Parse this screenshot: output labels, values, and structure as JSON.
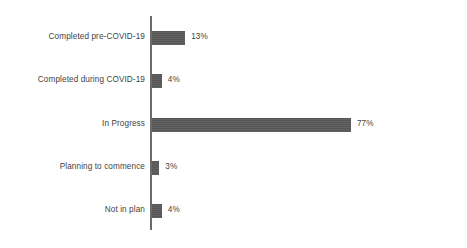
{
  "chart_data": {
    "type": "bar",
    "orientation": "horizontal",
    "title": "",
    "subtitle": "",
    "xlabel": "",
    "ylabel": "",
    "xlim": [
      0,
      100
    ],
    "grid": false,
    "legend": false,
    "axis_line": true,
    "bar_color": "#5a5a5a",
    "label_color": "#3f3f3f",
    "categories": [
      "Completed pre-COVID-19",
      "Completed during COVID-19",
      "In Progress",
      "Planning to commence",
      "Not in plan"
    ],
    "values": [
      13,
      4,
      77,
      3,
      4
    ],
    "value_labels": [
      "13%",
      "4%",
      "77%",
      "3%",
      "4%"
    ]
  },
  "bars": [
    {
      "label": "Completed pre-COVID-19",
      "value": 13,
      "value_label": "13%"
    },
    {
      "label": "Completed during COVID-19",
      "value": 4,
      "value_label": "4%"
    },
    {
      "label": "In Progress",
      "value": 77,
      "value_label": "77%"
    },
    {
      "label": "Planning to commence",
      "value": 3,
      "value_label": "3%"
    },
    {
      "label": "Not in plan",
      "value": 4,
      "value_label": "4%"
    }
  ]
}
